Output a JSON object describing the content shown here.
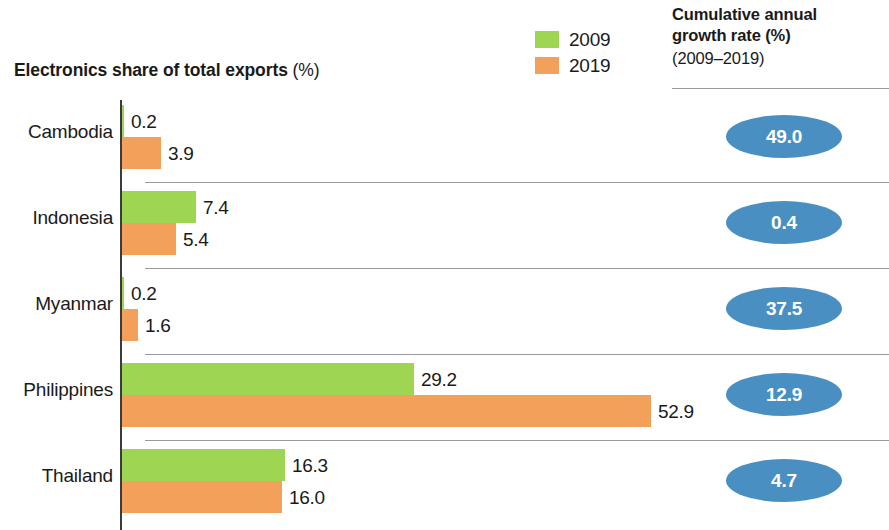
{
  "chart_title": {
    "main": "Electronics share of total exports",
    "unit": "(%)"
  },
  "legend": {
    "items": [
      {
        "label": "2009",
        "color": "#9ED654",
        "key": "y2009"
      },
      {
        "label": "2019",
        "color": "#F2A05A",
        "key": "y2019"
      }
    ]
  },
  "cagr_header": {
    "line1": "Cumulative annual",
    "line2": "growth rate (%)",
    "period": "(2009–2019)"
  },
  "colors": {
    "green_2009": "#9ED654",
    "orange_2019": "#F2A05A",
    "bubble_blue": "#4A8FC2",
    "axis": "#3b3b3b",
    "separator": "#9a9a9a",
    "text": "#1a1a1a",
    "bubble_text": "#ffffff"
  },
  "chart_data": {
    "type": "bar",
    "orientation": "horizontal",
    "title": "Electronics share of total exports (%)",
    "xlabel": "",
    "ylabel": "",
    "xlim": [
      0,
      56
    ],
    "grid": false,
    "legend_position": "top-right",
    "categories": [
      "Cambodia",
      "Indonesia",
      "Myanmar",
      "Philippines",
      "Thailand"
    ],
    "series": [
      {
        "name": "2009",
        "color": "#9ED654",
        "values": [
          0.2,
          7.4,
          0.2,
          29.2,
          16.3
        ]
      },
      {
        "name": "2019",
        "color": "#F2A05A",
        "values": [
          3.9,
          5.4,
          1.6,
          52.9,
          16.0
        ]
      }
    ],
    "annotations": {
      "name": "Cumulative annual growth rate (%) (2009–2019)",
      "values": [
        49.0,
        0.4,
        37.5,
        12.9,
        4.7
      ],
      "display": [
        "49.0",
        "0.4",
        "37.5",
        "12.9",
        "4.7"
      ]
    }
  },
  "rows": [
    {
      "label": "Cambodia",
      "v2009": "0.2",
      "w2009": 2,
      "v2019": "3.9",
      "w2019": 39,
      "cagr": "49.0",
      "separator": false
    },
    {
      "label": "Indonesia",
      "v2009": "7.4",
      "w2009": 74,
      "v2019": "5.4",
      "w2019": 54,
      "cagr": "0.4",
      "separator": true
    },
    {
      "label": "Myanmar",
      "v2009": "0.2",
      "w2009": 2,
      "v2019": "1.6",
      "w2019": 16,
      "cagr": "37.5",
      "separator": true
    },
    {
      "label": "Philippines",
      "v2009": "29.2",
      "w2009": 292,
      "v2019": "52.9",
      "w2019": 529,
      "cagr": "12.9",
      "separator": true
    },
    {
      "label": "Thailand",
      "v2009": "16.3",
      "w2009": 163,
      "v2019": "16.0",
      "w2019": 160,
      "cagr": "4.7",
      "separator": true
    }
  ]
}
